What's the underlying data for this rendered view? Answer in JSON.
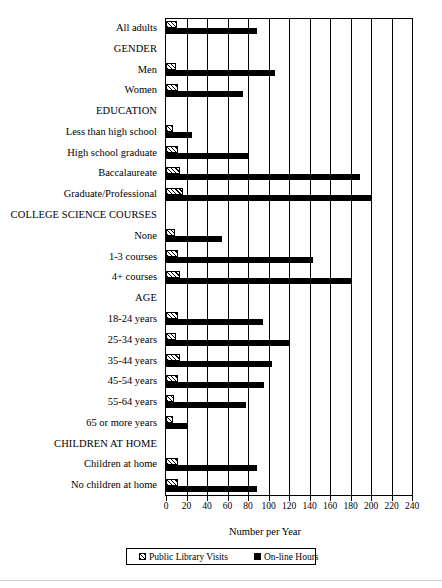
{
  "chart_data": {
    "type": "bar",
    "orientation": "horizontal",
    "title": "",
    "xlabel": "Number per Year",
    "ylabel": "",
    "xlim": [
      0,
      240
    ],
    "xticks": [
      0,
      20,
      40,
      60,
      80,
      100,
      120,
      140,
      160,
      180,
      200,
      220,
      240
    ],
    "grid": "vertical",
    "legend_position": "bottom",
    "categories": [
      "All adults",
      "GENDER",
      "Men",
      "Women",
      "EDUCATION",
      "Less than high school",
      "High school graduate",
      "Baccalaureate",
      "Graduate/Professional",
      "COLLEGE SCIENCE COURSES",
      "None",
      "1-3 courses",
      "4+ courses",
      "AGE",
      "18-24 years",
      "25-34 years",
      "35-44 years",
      "45-54 years",
      "55-64 years",
      "65 or more years",
      "CHILDREN AT HOME",
      "Children at home",
      "No children at home"
    ],
    "section_headers": [
      "GENDER",
      "EDUCATION",
      "COLLEGE SCIENCE COURSES",
      "AGE",
      "CHILDREN AT HOME"
    ],
    "series": [
      {
        "name": "Public Library Visits",
        "style": "hatched",
        "values": [
          11,
          null,
          10,
          12,
          null,
          7,
          12,
          14,
          17,
          null,
          9,
          12,
          14,
          null,
          12,
          10,
          14,
          12,
          8,
          7,
          null,
          12,
          12
        ]
      },
      {
        "name": "On-line Hours",
        "style": "solid-black",
        "values": [
          89,
          null,
          106,
          75,
          null,
          25,
          80,
          189,
          200,
          null,
          55,
          143,
          180,
          null,
          95,
          120,
          103,
          96,
          78,
          21,
          null,
          89,
          89
        ]
      }
    ]
  },
  "legend": {
    "items": [
      {
        "label": "Public Library Visits",
        "swatch": "hatched"
      },
      {
        "label": "On-line Hours",
        "swatch": "solid"
      }
    ]
  },
  "axis": {
    "x_title": "Number per Year"
  }
}
